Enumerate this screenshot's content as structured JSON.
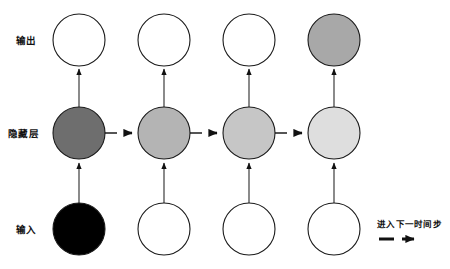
{
  "diagram": {
    "title_text": "",
    "background_color": "#ffffff",
    "stroke_color": "#1a1a1a",
    "rows": [
      {
        "key": "output",
        "label": "输出",
        "label_x": 16,
        "label_y": 40,
        "cy": 40
      },
      {
        "key": "hidden",
        "label": "隐藏层",
        "label_x": 8,
        "label_y": 133,
        "cy": 133
      },
      {
        "key": "input",
        "label": "输入",
        "label_x": 16,
        "label_y": 229,
        "cy": 229
      }
    ],
    "columns_x": [
      79,
      164,
      249,
      334
    ],
    "radius": 26,
    "nodes": {
      "output": [
        {
          "step": 1,
          "fill": "#ffffff",
          "cx": 79
        },
        {
          "step": 2,
          "fill": "#ffffff",
          "cx": 164
        },
        {
          "step": 3,
          "fill": "#ffffff",
          "cx": 249
        },
        {
          "step": 4,
          "fill": "#a8a8a8",
          "cx": 334
        }
      ],
      "hidden": [
        {
          "step": 1,
          "fill": "#6e6e6e",
          "cx": 79
        },
        {
          "step": 2,
          "fill": "#b4b4b4",
          "cx": 164
        },
        {
          "step": 3,
          "fill": "#c6c6c6",
          "cx": 249
        },
        {
          "step": 4,
          "fill": "#dedede",
          "cx": 334
        }
      ],
      "input": [
        {
          "step": 1,
          "fill": "#000000",
          "cx": 79
        },
        {
          "step": 2,
          "fill": "#ffffff",
          "cx": 164
        },
        {
          "step": 3,
          "fill": "#ffffff",
          "cx": 249
        },
        {
          "step": 4,
          "fill": "#ffffff",
          "cx": 334
        }
      ]
    },
    "recurrent_arrow_count": 3,
    "legend": {
      "label": "进入下一时间步",
      "label_x": 377,
      "label_y": 224,
      "dash_y": 238,
      "color": "#111111"
    }
  }
}
